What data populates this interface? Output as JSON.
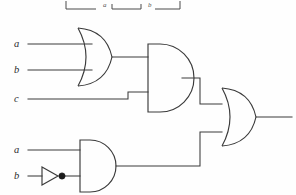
{
  "figure": {
    "kind": "logic-circuit-diagram",
    "background_color": "#fefefe",
    "line_color": "#3a3a3a"
  },
  "cropped_header": {
    "present": true,
    "note": "bottom edge of a bracketed expression cut off by the page crop",
    "labels": [
      {
        "text": "a",
        "x": 103,
        "y": 6
      },
      {
        "text": "b",
        "x": 148,
        "y": 6
      }
    ]
  },
  "inputs": [
    {
      "id": "in-a-top",
      "label": "a",
      "x": 14,
      "y": 47,
      "wire_y": 44
    },
    {
      "id": "in-b-top",
      "label": "b",
      "x": 14,
      "y": 73,
      "wire_y": 70
    },
    {
      "id": "in-c",
      "label": "c",
      "x": 14,
      "y": 102,
      "wire_y": 99
    },
    {
      "id": "in-a-bottom",
      "label": "a",
      "x": 14,
      "y": 153,
      "wire_y": 150
    },
    {
      "id": "in-b-bottom",
      "label": "b",
      "x": 14,
      "y": 179,
      "wire_y": 176
    }
  ],
  "gates": [
    {
      "id": "or-gate-1",
      "type": "OR",
      "inputs": [
        "a",
        "b"
      ],
      "output_y": 57
    },
    {
      "id": "and-gate-1",
      "type": "AND",
      "inputs": [
        "or-gate-1",
        "c"
      ],
      "output_y": 78
    },
    {
      "id": "not-gate-1",
      "type": "NOT",
      "inputs": [
        "b"
      ],
      "output_y": 176
    },
    {
      "id": "and-gate-2",
      "type": "AND",
      "inputs": [
        "a",
        "not-gate-1"
      ],
      "output_y": 166
    },
    {
      "id": "or-gate-2",
      "type": "OR",
      "inputs": [
        "and-gate-1",
        "and-gate-2"
      ],
      "output_y": 117
    }
  ],
  "output": {
    "id": "circuit-output",
    "label": "",
    "x": 290,
    "y": 117
  }
}
